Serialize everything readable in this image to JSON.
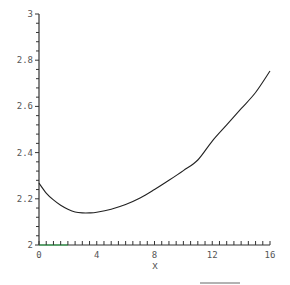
{
  "chart_data": {
    "type": "line",
    "title": "",
    "xlabel": "x",
    "ylabel": "",
    "xlim": [
      0,
      16
    ],
    "ylim": [
      2,
      3
    ],
    "grid": false,
    "legend": null,
    "x_ticks": [
      "0",
      "4",
      "8",
      "12",
      "16"
    ],
    "y_ticks": [
      "2",
      "2.2",
      "2.4",
      "2.6",
      "2.8",
      "3"
    ],
    "series": [
      {
        "name": "curve",
        "color": "#222222",
        "x": [
          0,
          0.5,
          1,
          1.5,
          2,
          2.5,
          3,
          3.5,
          4,
          5,
          6,
          7,
          8,
          9,
          10,
          11,
          12,
          13,
          14,
          15,
          16
        ],
        "values": [
          2.268,
          2.225,
          2.195,
          2.172,
          2.155,
          2.143,
          2.139,
          2.139,
          2.142,
          2.155,
          2.175,
          2.203,
          2.24,
          2.28,
          2.322,
          2.368,
          2.45,
          2.52,
          2.59,
          2.66,
          2.753
        ]
      }
    ]
  },
  "axis_colors": {
    "axis": "#333333",
    "baseline_accent": "#22aa44"
  }
}
